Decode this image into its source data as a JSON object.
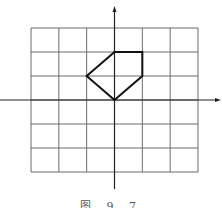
{
  "figure": {
    "caption": "图 9.7",
    "grid": {
      "cols": 6,
      "rows": 6,
      "x_range": [
        -3,
        3
      ],
      "y_range": [
        -3,
        3
      ]
    },
    "axes": {
      "x_arrow": true,
      "y_arrow": true
    },
    "polygon": {
      "vertices": [
        [
          0,
          0
        ],
        [
          -1,
          1
        ],
        [
          0,
          2
        ],
        [
          1,
          2
        ],
        [
          1,
          1
        ]
      ],
      "stroke": "#111111"
    },
    "colors": {
      "grid": "#6b6b6b",
      "axis": "#222222",
      "shape": "#111111"
    }
  }
}
